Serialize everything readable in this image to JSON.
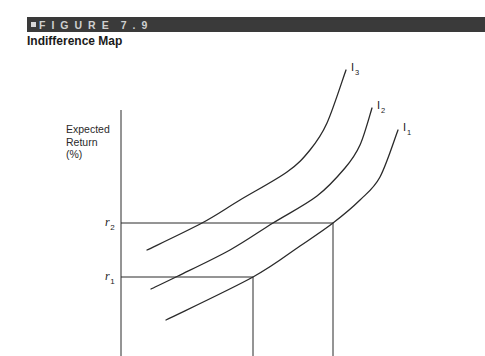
{
  "figure": {
    "bullet": "■",
    "label": "FIGURE",
    "number": "7.9",
    "title": "Indifference Map"
  },
  "axes": {
    "ylabel_lines": [
      "Expected",
      "Return",
      "(%)"
    ]
  },
  "colors": {
    "header_bar": "#3a3a3a",
    "header_text": "#cfcfcf",
    "line": "#2a2a2a"
  },
  "chart_data": {
    "type": "line",
    "title": "Indifference Map",
    "xlabel": "",
    "ylabel": "Expected Return (%)",
    "grid": false,
    "legend": "none (curves labeled inline at their upper ends)",
    "series": [
      {
        "name": "I1",
        "label_main": "I",
        "label_sub": "1",
        "points": [
          [
            166,
            320
          ],
          [
            253,
            277
          ],
          [
            300,
            246
          ],
          [
            333,
            223
          ],
          [
            360,
            200
          ],
          [
            380,
            177
          ],
          [
            398,
            130
          ]
        ]
      },
      {
        "name": "I2",
        "label_main": "I",
        "label_sub": "2",
        "points": [
          [
            151,
            289
          ],
          [
            178,
            276
          ],
          [
            230,
            250
          ],
          [
            273,
            223
          ],
          [
            317,
            196
          ],
          [
            345,
            168
          ],
          [
            360,
            145
          ],
          [
            372,
            108
          ]
        ]
      },
      {
        "name": "I3",
        "label_main": "I",
        "label_sub": "3",
        "points": [
          [
            147,
            250
          ],
          [
            202,
            223
          ],
          [
            240,
            200
          ],
          [
            287,
            172
          ],
          [
            310,
            150
          ],
          [
            327,
            123
          ],
          [
            346,
            70
          ]
        ]
      }
    ],
    "reference_levels": [
      {
        "name": "r2",
        "label_main": "r",
        "label_sub": "2",
        "y": 223,
        "x_end": 333,
        "on_curve": "I1"
      },
      {
        "name": "r1",
        "label_main": "r",
        "label_sub": "1",
        "y": 277,
        "x_end": 253,
        "on_curve": "I1"
      }
    ],
    "annotations": [
      "I1",
      "I2",
      "I3",
      "r1",
      "r2"
    ]
  }
}
